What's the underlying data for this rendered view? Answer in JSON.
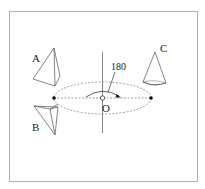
{
  "figure": {
    "labels": {
      "A": "A",
      "B": "B",
      "C": "C",
      "origin": "O",
      "angle": "180"
    },
    "colors": {
      "background": "#ffffff",
      "frame": "#b0b0b0",
      "line": "#555555",
      "dashed": "#888888",
      "dot": "#111111"
    },
    "objects": [
      {
        "id": "A",
        "shape": "tetrahedron",
        "position": "upper-left"
      },
      {
        "id": "B",
        "shape": "tetrahedron",
        "position": "lower-left"
      },
      {
        "id": "C",
        "shape": "cone",
        "position": "upper-right"
      }
    ]
  }
}
